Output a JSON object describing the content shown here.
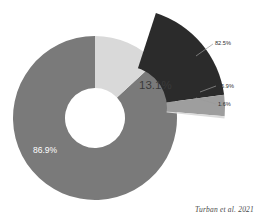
{
  "credit": "Turban et al. 2021",
  "chart_data": {
    "type": "pie",
    "title": "",
    "subtitle": "",
    "xlabel": "",
    "ylabel": "",
    "variant": "donut-with-exploded-breakout",
    "legend": "none",
    "grid": false,
    "main": {
      "categories": [
        "86.9%",
        "13.1%"
      ],
      "values": [
        86.9,
        13.1
      ],
      "labels": [
        "86.9%",
        "13.1%"
      ],
      "colors": [
        "#7a7a7a",
        "#d9d9d9"
      ],
      "label_colors": [
        "#ffffff",
        "#3a3a3a"
      ]
    },
    "breakout": {
      "of_category": "13.1%",
      "categories": [
        "82.5%",
        "15.9%",
        "1.6%"
      ],
      "values": [
        82.5,
        15.9,
        1.6
      ],
      "labels": [
        "82.5%",
        "15.9%",
        "1.6%"
      ],
      "colors": [
        "#2b2b2b",
        "#9e9e9e",
        "#dcdcdc"
      ]
    }
  },
  "labels": {
    "main_large": "86.9%",
    "main_small": "13.1%",
    "callout_1": "82.5%",
    "callout_2": "15.9%",
    "callout_3": "1.6%"
  },
  "colors": {
    "segment_major": "#7a7a7a",
    "segment_minor": "#d9d9d9",
    "breakout_major": "#2b2b2b",
    "breakout_mid": "#9e9e9e",
    "breakout_small": "#dcdcdc",
    "background": "#ffffff",
    "leader_line": "#9a9a9a"
  }
}
